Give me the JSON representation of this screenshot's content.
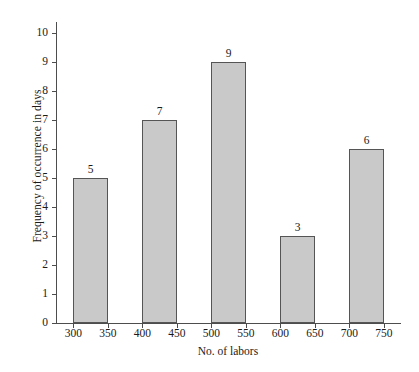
{
  "chart_data": {
    "type": "bar",
    "title": "",
    "xlabel": "No. of labors",
    "ylabel": "Frequency of occurrence in days",
    "categories": [
      "300-350",
      "400-450",
      "500-550",
      "600-650",
      "700-750"
    ],
    "values": [
      5,
      7,
      9,
      3,
      6
    ],
    "value_labels": [
      "5",
      "7",
      "9",
      "3",
      "6"
    ],
    "ylim": [
      0,
      10
    ],
    "ytick_labels": [
      "0",
      "1",
      "2",
      "3",
      "4",
      "5",
      "6",
      "7",
      "8",
      "9",
      "10"
    ],
    "ytick_values": [
      0,
      1,
      2,
      3,
      4,
      5,
      6,
      7,
      8,
      9,
      10
    ],
    "xtick_labels": [
      "300",
      "350",
      "400",
      "450",
      "500",
      "550",
      "600",
      "650",
      "700",
      "750"
    ],
    "xtick_values": [
      300,
      350,
      400,
      450,
      500,
      550,
      600,
      650,
      700,
      750
    ],
    "xlim": [
      275,
      775
    ],
    "grid": false,
    "legend": false,
    "bar_fill_color": "#c9c9c9",
    "bar_edge_color": "#555555",
    "axis_color": "#4d4d4d",
    "background_color": "#ffffff",
    "bars": [
      {
        "label": "5",
        "value": 5,
        "bin_start": 300,
        "bin_end": 350
      },
      {
        "label": "7",
        "value": 7,
        "bin_start": 400,
        "bin_end": 450
      },
      {
        "label": "9",
        "value": 9,
        "bin_start": 500,
        "bin_end": 550
      },
      {
        "label": "3",
        "value": 3,
        "bin_start": 600,
        "bin_end": 650
      },
      {
        "label": "6",
        "value": 6,
        "bin_start": 700,
        "bin_end": 750
      }
    ]
  }
}
